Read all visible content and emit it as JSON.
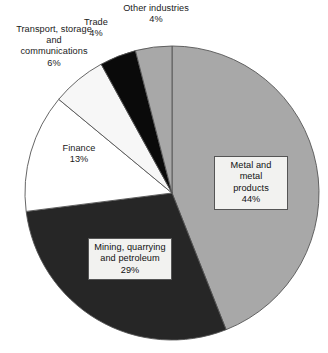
{
  "chart_data": {
    "type": "pie",
    "title": "",
    "subtitle": "",
    "xlabel": "",
    "ylabel": "",
    "legend_position": "none",
    "grid": false,
    "units": "percent",
    "start_angle_deg": 0,
    "direction": "clockwise",
    "categories": [
      "Metal and metal products",
      "Mining, quarrying and petroleum",
      "Finance",
      "Transport, storage and communications",
      "Trade",
      "Other industries"
    ],
    "values": [
      44,
      29,
      13,
      6,
      4,
      4
    ],
    "total": 100,
    "slices": [
      {
        "label": "Metal and metal products",
        "value": 44,
        "pct_text": "44%",
        "color": "#a8a8a8",
        "label_style": "boxed",
        "label_line1": "Metal and metal",
        "label_line2": "products",
        "start_deg": 0,
        "end_deg": 158.4
      },
      {
        "label": "Mining, quarrying and petroleum",
        "value": 29,
        "pct_text": "29%",
        "color": "#262626",
        "label_style": "boxed",
        "label_line1": "Mining, quarrying",
        "label_line2": "and petroleum",
        "start_deg": 158.4,
        "end_deg": 262.8
      },
      {
        "label": "Finance",
        "value": 13,
        "pct_text": "13%",
        "color": "#ffffff",
        "label_style": "outside",
        "label_line1": "Finance",
        "start_deg": 262.8,
        "end_deg": 309.6
      },
      {
        "label": "Transport, storage and communications",
        "value": 6,
        "pct_text": "6%",
        "color": "#f7f7f7",
        "label_style": "outside",
        "label_line1": "Transport, storage",
        "label_line2": "and",
        "label_line3": "communications",
        "start_deg": 309.6,
        "end_deg": 331.2
      },
      {
        "label": "Trade",
        "value": 4,
        "pct_text": "4%",
        "color": "#0a0a0a",
        "label_style": "outside",
        "label_line1": "Trade",
        "start_deg": 331.2,
        "end_deg": 345.6
      },
      {
        "label": "Other industries",
        "value": 4,
        "pct_text": "4%",
        "color": "#a8a8a8",
        "label_style": "outside",
        "label_line1": "Other industries",
        "start_deg": 345.6,
        "end_deg": 360
      }
    ]
  },
  "labels": {
    "metal": {
      "text": "Metal and metal\nproducts\n44%"
    },
    "mining": {
      "text": "Mining, quarrying\nand petroleum\n29%"
    },
    "finance": {
      "text": "Finance\n13%"
    },
    "transport": {
      "text": "Transport, storage\nand\ncommunications\n6%"
    },
    "trade": {
      "text": "Trade\n4%"
    },
    "other": {
      "text": "Other industries\n4%"
    }
  },
  "geometry": {
    "center_x": 172,
    "center_y": 193,
    "radius": 147,
    "stroke": "#555555",
    "stroke_width": 0.9
  },
  "colors": {
    "background": "#ffffff",
    "outline": "#555555",
    "gray_slice": "#a8a8a8",
    "dark_slice": "#262626",
    "black_slice": "#0a0a0a",
    "white_slice": "#ffffff",
    "label_box_bg": "#f2f2f0",
    "text": "#1a1a1a"
  }
}
